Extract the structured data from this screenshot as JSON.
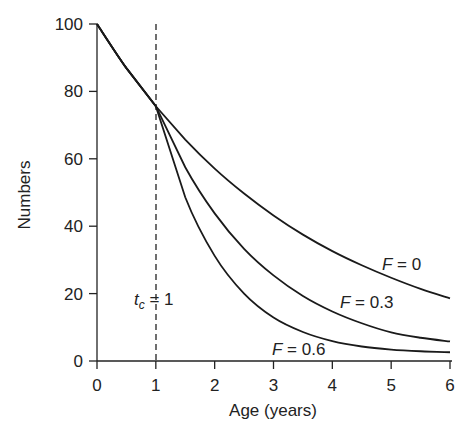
{
  "chart_data": {
    "type": "line",
    "title": "",
    "xlabel": "Age (years)",
    "ylabel": "Numbers",
    "xlim": [
      0,
      6
    ],
    "ylim": [
      0,
      100
    ],
    "x_ticks": [
      "0",
      "1",
      "2",
      "3",
      "4",
      "5",
      "6"
    ],
    "y_ticks": [
      "0",
      "20",
      "40",
      "60",
      "80",
      "100"
    ],
    "grid": false,
    "legend": "inline labels",
    "x": [
      0,
      0.5,
      1,
      1.5,
      2,
      2.5,
      3,
      3.5,
      4,
      4.5,
      5,
      5.5,
      6
    ],
    "series": [
      {
        "name": "F = 0",
        "values": [
          100,
          86.9,
          75.6,
          65.7,
          57.1,
          49.7,
          43.2,
          37.5,
          32.6,
          28.4,
          24.7,
          21.4,
          18.6
        ]
      },
      {
        "name": "F = 0.3",
        "values": [
          100,
          86.9,
          75.6,
          57.5,
          43.8,
          33.3,
          25.4,
          19.3,
          14.7,
          11.2,
          8.5,
          6.9,
          5.8
        ]
      },
      {
        "name": "F = 0.6",
        "values": [
          100,
          86.9,
          75.6,
          48.6,
          31.2,
          20.0,
          12.9,
          8.6,
          5.9,
          4.3,
          3.4,
          2.9,
          2.6
        ]
      }
    ],
    "annotations": [
      {
        "text": "t_c = 1",
        "type": "vertical dashed line",
        "x": 1
      }
    ]
  },
  "labels": {
    "ylabel": "Numbers",
    "xlabel": "Age (years)",
    "f0": "F = 0",
    "f03": "F = 0.3",
    "f06": "F = 0.6",
    "tc_main": "t",
    "tc_sub": "c",
    "tc_rest": " = 1"
  }
}
